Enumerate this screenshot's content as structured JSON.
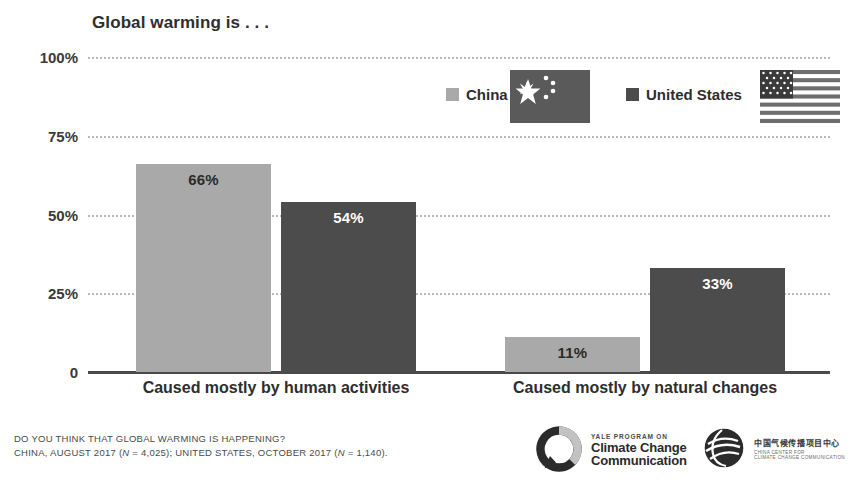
{
  "chart_data": {
    "type": "bar",
    "title": "Global warming is . . .",
    "xlabel": "",
    "ylabel": "",
    "ylim": [
      0,
      100
    ],
    "grid": true,
    "legend_position": "top-right",
    "categories": [
      "Caused mostly by human activities",
      "Caused mostly by natural changes"
    ],
    "series": [
      {
        "name": "China",
        "color": "#a9a9a9",
        "values": [
          66,
          11
        ],
        "labels": [
          "66%",
          "11%"
        ]
      },
      {
        "name": "United States",
        "color": "#4c4c4c",
        "values": [
          54,
          33
        ],
        "labels": [
          "54%",
          "33%"
        ]
      }
    ],
    "yticks": [
      "100%",
      "75%",
      "50%",
      "25%",
      "0"
    ],
    "ytick_values": [
      100,
      75,
      50,
      25,
      0
    ]
  },
  "legend": {
    "items": [
      {
        "label": "China",
        "swatch_color": "#a9a9a9",
        "flag": "flag-china"
      },
      {
        "label": "United States",
        "swatch_color": "#4c4c4c",
        "flag": "flag-united-states"
      }
    ]
  },
  "footer": {
    "question": "DO YOU THINK THAT GLOBAL WARMING IS HAPPENING?",
    "source_pre": "CHINA, AUGUST 2017 (",
    "source_n1_italic": "N",
    "source_mid": " = 4,025); UNITED STATES, OCTOBER 2017 (",
    "source_n2_italic": "N",
    "source_post": " = 1,140)."
  },
  "logos": {
    "yale": {
      "kicker": "YALE PROGRAM ON",
      "line1": "Climate Change",
      "line2": "Communication"
    },
    "c4": {
      "chinese": "中国气候传播项目中心",
      "sub1": "CHINA CENTER FOR",
      "sub2": "CLIMATE CHANGE COMMUNICATION"
    }
  }
}
